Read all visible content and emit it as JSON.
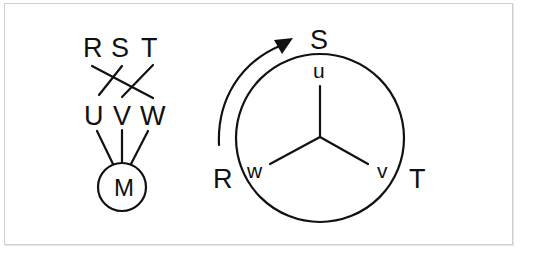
{
  "diagram": {
    "type": "three-phase motor wiring / phase rotation diagram",
    "colors": {
      "stroke": "#111111",
      "background": "#ffffff",
      "frame": "#cfcfcf"
    },
    "left": {
      "supply_labels": [
        "R",
        "S",
        "T"
      ],
      "terminal_labels": [
        "U",
        "V",
        "W"
      ],
      "motor_label": "M",
      "connections": [
        {
          "from": "R",
          "to": "W"
        },
        {
          "from": "S",
          "to": "U"
        },
        {
          "from": "T",
          "to": "V"
        }
      ]
    },
    "right": {
      "outer_labels": {
        "top": "S",
        "left": "R",
        "right": "T"
      },
      "winding_labels": {
        "top": "u",
        "left": "w",
        "right": "v"
      },
      "rotation_arrow": "arrow from R toward S (clockwise)"
    }
  }
}
